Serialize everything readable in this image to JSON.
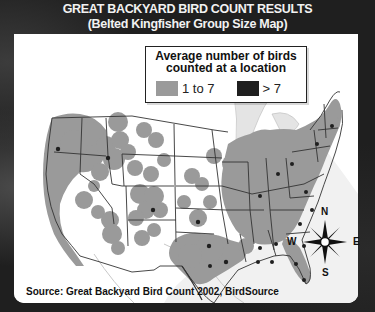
{
  "title": {
    "line1": "GREAT BACKYARD BIRD COUNT RESULTS",
    "line2": "(Belted Kingfisher Group Size Map)"
  },
  "legend": {
    "title": "Average number of birds counted at a location",
    "items": [
      {
        "label": "1 to 7",
        "color": "#9a9a9a"
      },
      {
        "label": "> 7",
        "color": "#1f1f1f"
      }
    ]
  },
  "compass": {
    "n": "N",
    "s": "S",
    "e": "E",
    "w": "W"
  },
  "source": "Source: Great Backyard Bird Count 2002, BirdSource",
  "colors": {
    "frame": "#1f1f1f",
    "map_bg": "#ffffff",
    "presence_low": "#9a9a9a",
    "presence_high": "#1f1f1f",
    "water": "#e6e6e6",
    "borders": "#333333"
  }
}
